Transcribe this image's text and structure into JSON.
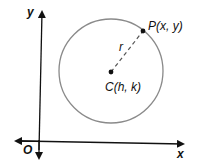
{
  "diagram": {
    "type": "circle-on-coordinate-plane",
    "axes": {
      "x_label": "x",
      "y_label": "y",
      "origin_label": "O"
    },
    "circle": {
      "center_label": "C(h, k)",
      "point_label": "P(x, y)",
      "radius_label": "r"
    },
    "colors": {
      "axis": "#111111",
      "circle": "#8a8a8a",
      "radius": "#555555",
      "points": "#111111"
    }
  }
}
